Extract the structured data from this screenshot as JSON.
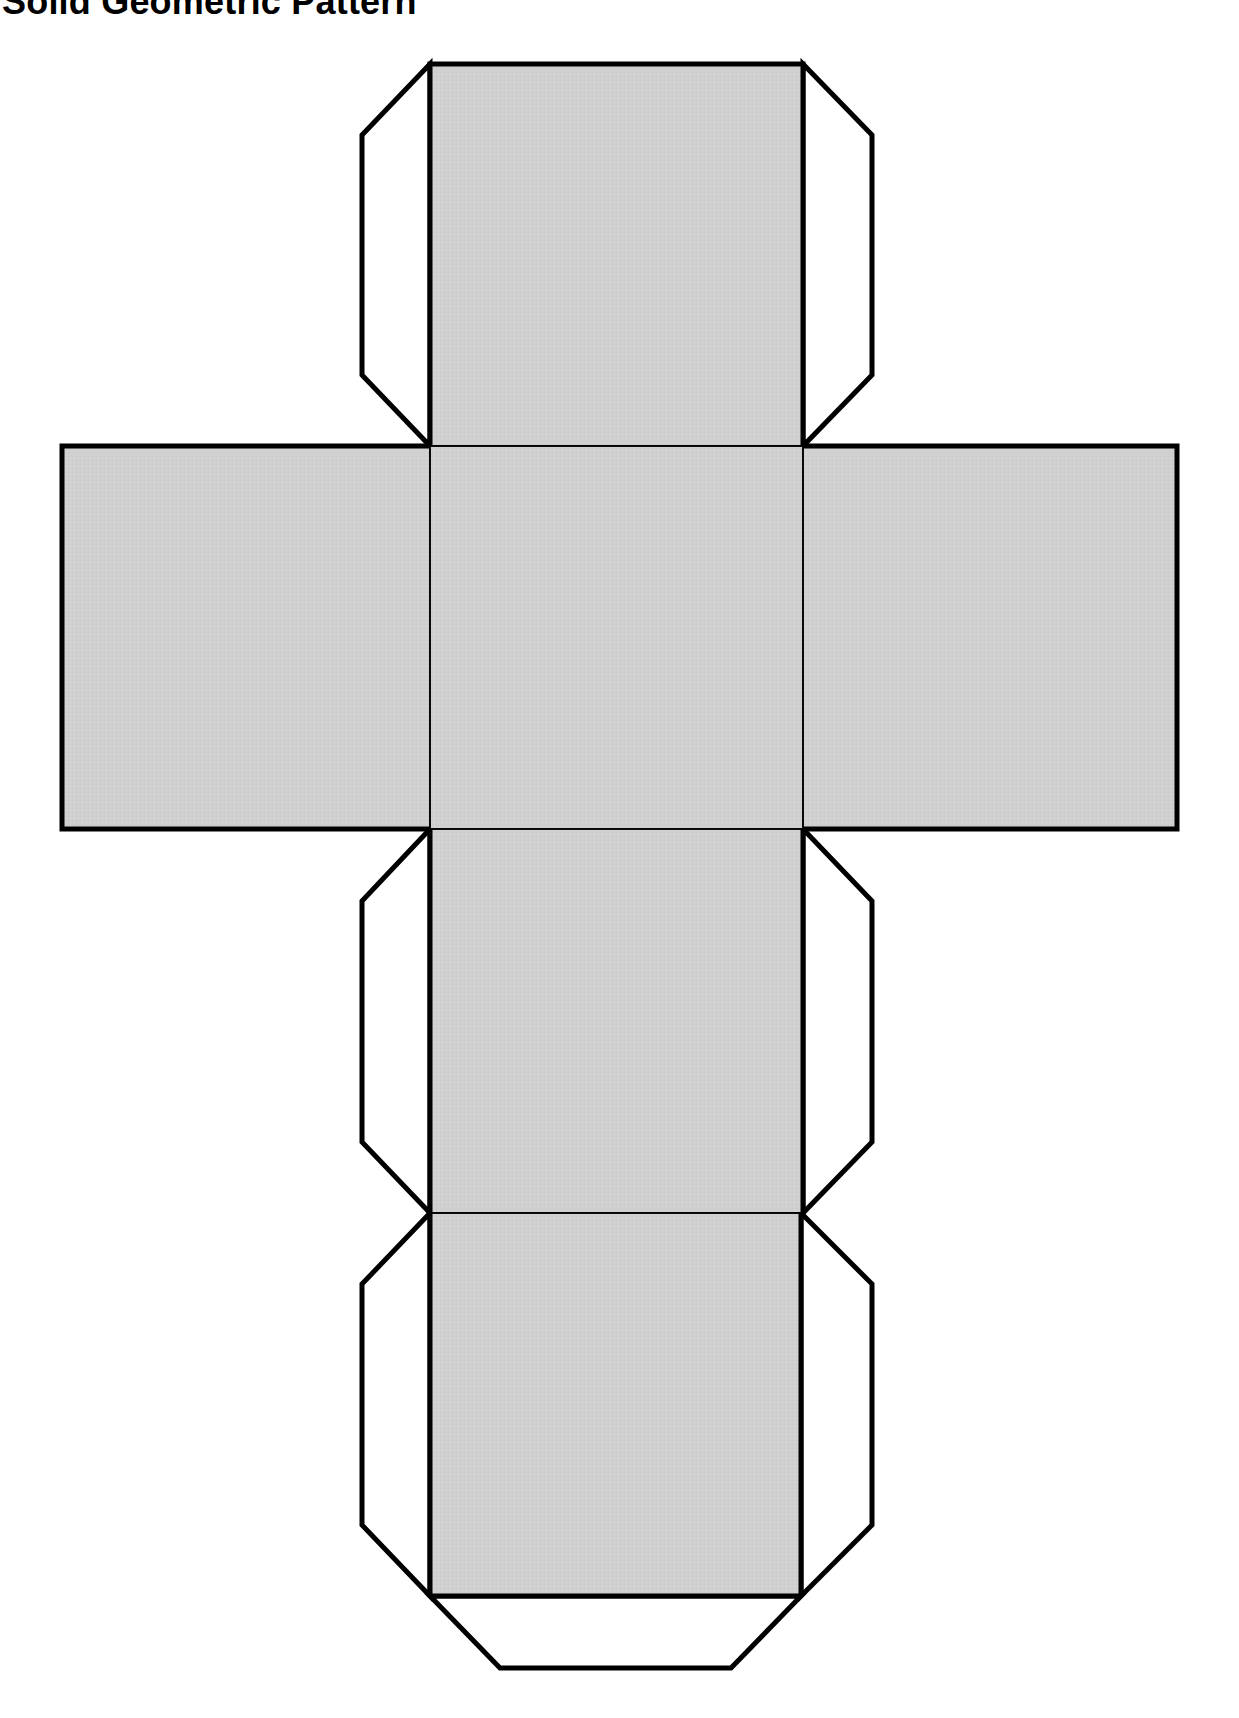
{
  "page": {
    "title": "Solid Geometric Pattern"
  },
  "colors": {
    "face_fill": "#d0d0d0",
    "flap_fill": "#ffffff",
    "outline": "#000000",
    "background": "#ffffff"
  },
  "net": {
    "type": "cube-net",
    "faces": [
      {
        "id": "top-face",
        "label": "top"
      },
      {
        "id": "left-face",
        "label": "left"
      },
      {
        "id": "center-face",
        "label": "center"
      },
      {
        "id": "right-face",
        "label": "right"
      },
      {
        "id": "lower-face-1",
        "label": "lower-1"
      },
      {
        "id": "bottom-face",
        "label": "bottom"
      }
    ],
    "flaps": [
      {
        "id": "flap-top-left"
      },
      {
        "id": "flap-top-right"
      },
      {
        "id": "flap-lower1-left"
      },
      {
        "id": "flap-lower1-right"
      },
      {
        "id": "flap-bottom-left"
      },
      {
        "id": "flap-bottom-right"
      },
      {
        "id": "flap-bottom-end"
      }
    ]
  }
}
